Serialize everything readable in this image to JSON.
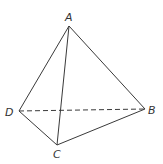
{
  "diagram": {
    "type": "tetrahedron",
    "vertices": [
      {
        "id": "A",
        "label": "A"
      },
      {
        "id": "B",
        "label": "B"
      },
      {
        "id": "C",
        "label": "C"
      },
      {
        "id": "D",
        "label": "D"
      }
    ],
    "edges": [
      {
        "from": "A",
        "to": "B",
        "style": "solid"
      },
      {
        "from": "A",
        "to": "C",
        "style": "solid"
      },
      {
        "from": "A",
        "to": "D",
        "style": "solid"
      },
      {
        "from": "B",
        "to": "C",
        "style": "solid"
      },
      {
        "from": "C",
        "to": "D",
        "style": "solid"
      },
      {
        "from": "D",
        "to": "B",
        "style": "dashed"
      }
    ],
    "colors": {
      "line": "#3a3a3a",
      "label": "#333333",
      "background": "#ffffff"
    }
  }
}
